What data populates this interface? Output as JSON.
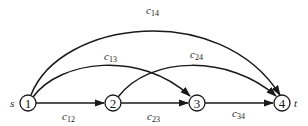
{
  "diagram": {
    "type": "directed-network",
    "source_label": "s",
    "sink_label": "t",
    "nodes": [
      {
        "id": "1",
        "label": "1"
      },
      {
        "id": "2",
        "label": "2"
      },
      {
        "id": "3",
        "label": "3"
      },
      {
        "id": "4",
        "label": "4"
      }
    ],
    "edges": [
      {
        "from": "1",
        "to": "2",
        "label_base": "c",
        "label_sub": "12"
      },
      {
        "from": "2",
        "to": "3",
        "label_base": "c",
        "label_sub": "23"
      },
      {
        "from": "3",
        "to": "4",
        "label_base": "c",
        "label_sub": "34"
      },
      {
        "from": "1",
        "to": "3",
        "label_base": "c",
        "label_sub": "13"
      },
      {
        "from": "2",
        "to": "4",
        "label_base": "c",
        "label_sub": "24"
      },
      {
        "from": "1",
        "to": "4",
        "label_base": "c",
        "label_sub": "14"
      }
    ]
  }
}
